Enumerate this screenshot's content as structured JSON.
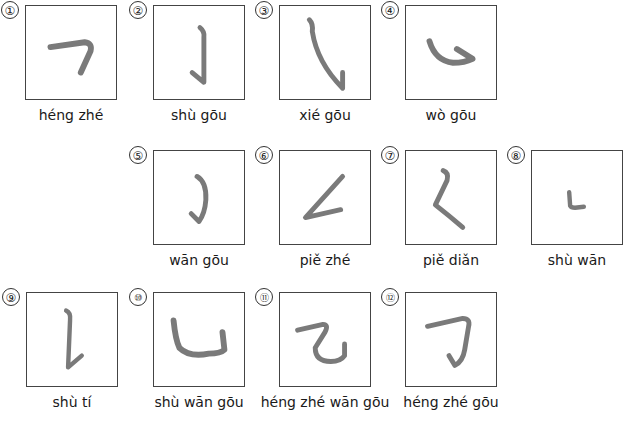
{
  "strokes": [
    {
      "number": "①",
      "pinyin": "héng zhé"
    },
    {
      "number": "②",
      "pinyin": "shù gōu"
    },
    {
      "number": "③",
      "pinyin": "xié gōu"
    },
    {
      "number": "④",
      "pinyin": "wò gōu"
    },
    {
      "number": "⑤",
      "pinyin": "wān gōu"
    },
    {
      "number": "⑥",
      "pinyin": "piě zhé"
    },
    {
      "number": "⑦",
      "pinyin": "piě diǎn"
    },
    {
      "number": "⑧",
      "pinyin": "shù wān"
    },
    {
      "number": "⑨",
      "pinyin": "shù tí"
    },
    {
      "number": "⑩",
      "pinyin": "shù wān gōu"
    },
    {
      "number": "⑪",
      "pinyin": "héng zhé wān gōu"
    },
    {
      "number": "⑫",
      "pinyin": "héng zhé gōu"
    }
  ],
  "stroke_color": "#7a7a7a"
}
